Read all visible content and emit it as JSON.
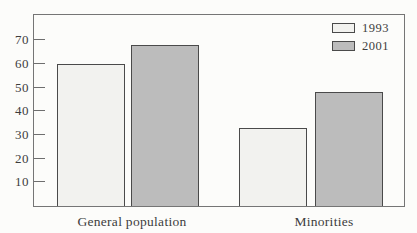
{
  "figure": {
    "background_color": "#fcfcfa",
    "frame_color": "#757575",
    "bar_border_color": "#4a4a4a",
    "text_color": "#3d3d3d"
  },
  "chart_data": {
    "type": "bar",
    "title": "",
    "xlabel": "",
    "ylabel": "",
    "categories": [
      "General population",
      "Minorities"
    ],
    "series": [
      {
        "name": "1993",
        "color": "#f2f2ef",
        "values": [
          60,
          33
        ]
      },
      {
        "name": "2001",
        "color": "#bcbcbc",
        "values": [
          68,
          48
        ]
      }
    ],
    "yticks": [
      10,
      20,
      30,
      40,
      50,
      60,
      70
    ],
    "ylim": [
      0,
      81
    ],
    "grid": false,
    "legend_position": "top-right",
    "tick_direction": "in"
  }
}
